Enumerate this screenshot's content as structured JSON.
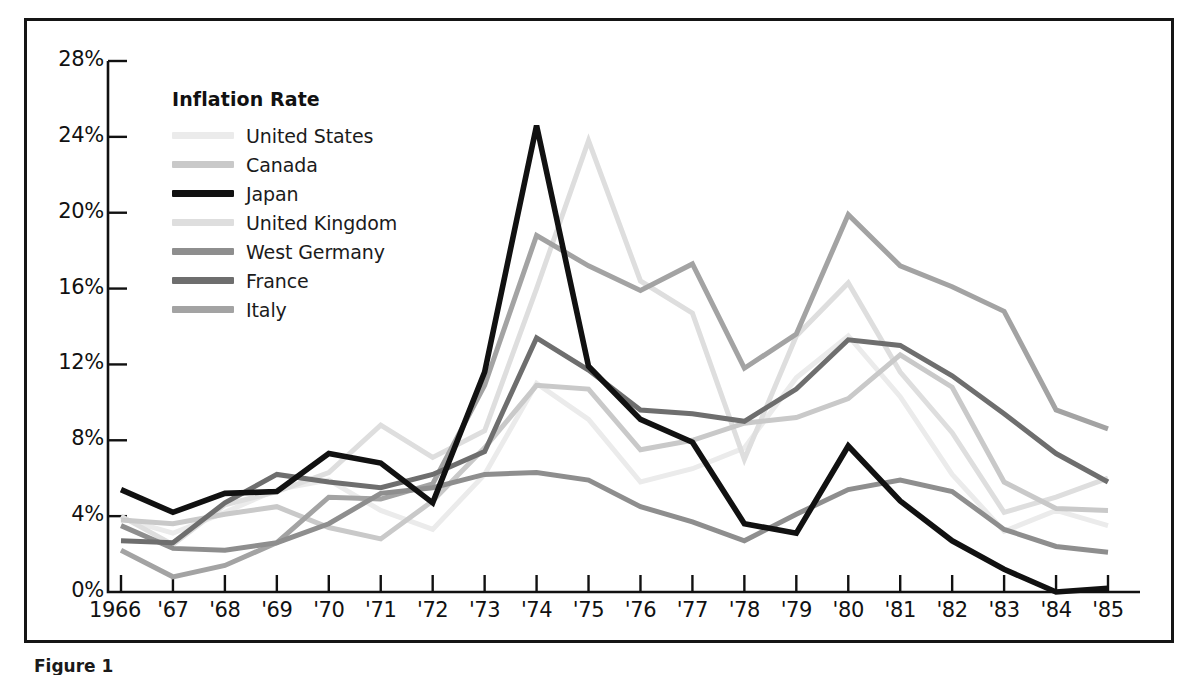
{
  "figure": {
    "caption": "Figure 1"
  },
  "legend": {
    "title": "Inflation Rate",
    "position": "inside-top-left",
    "entries": [
      {
        "label": "United States",
        "color": "#ebebeb"
      },
      {
        "label": "Canada",
        "color": "#c9c9c9"
      },
      {
        "label": "Japan",
        "color": "#111111"
      },
      {
        "label": "United Kingdom",
        "color": "#dedede"
      },
      {
        "label": "West Germany",
        "color": "#8e8e8e"
      },
      {
        "label": "France",
        "color": "#6e6e6e"
      },
      {
        "label": "Italy",
        "color": "#a3a3a3"
      }
    ]
  },
  "axes": {
    "y_ticks": [
      "0%",
      "4%",
      "8%",
      "12%",
      "16%",
      "20%",
      "24%",
      "28%"
    ],
    "x_ticks": [
      "1966",
      "'67",
      "'68",
      "'69",
      "'70",
      "'71",
      "'72",
      "'73",
      "'74",
      "'75",
      "'76",
      "'77",
      "'78",
      "'79",
      "'80",
      "'81",
      "'82",
      "'83",
      "'84",
      "'85"
    ]
  },
  "chart_data": {
    "type": "line",
    "title": "Inflation Rate",
    "xlabel": "",
    "ylabel": "Inflation Rate",
    "ylim": [
      0,
      28
    ],
    "ytick_values": [
      0,
      4,
      8,
      12,
      16,
      20,
      24,
      28
    ],
    "grid": false,
    "legend_position": "inside-top-left",
    "categories": [
      1966,
      1967,
      1968,
      1969,
      1970,
      1971,
      1972,
      1973,
      1974,
      1975,
      1976,
      1977,
      1978,
      1979,
      1980,
      1981,
      1982,
      1983,
      1984,
      1985
    ],
    "series": [
      {
        "name": "United States",
        "color": "#ebebeb",
        "values": [
          3.9,
          3.1,
          4.2,
          5.4,
          5.9,
          4.3,
          3.3,
          6.2,
          11.0,
          9.1,
          5.8,
          6.5,
          7.6,
          11.3,
          13.5,
          10.3,
          6.2,
          3.2,
          4.3,
          3.5
        ]
      },
      {
        "name": "Canada",
        "color": "#c9c9c9",
        "values": [
          3.8,
          3.6,
          4.1,
          4.5,
          3.4,
          2.8,
          4.8,
          7.6,
          10.9,
          10.7,
          7.5,
          8.0,
          8.9,
          9.2,
          10.2,
          12.5,
          10.8,
          5.8,
          4.4,
          4.3
        ]
      },
      {
        "name": "Japan",
        "color": "#111111",
        "values": [
          5.4,
          4.2,
          5.2,
          5.3,
          7.3,
          6.8,
          4.7,
          11.6,
          24.6,
          11.9,
          9.1,
          7.9,
          3.6,
          3.1,
          7.7,
          4.8,
          2.7,
          1.2,
          0.0,
          0.2
        ]
      },
      {
        "name": "United Kingdom",
        "color": "#dedede",
        "values": [
          4.0,
          2.5,
          4.6,
          5.3,
          6.3,
          8.8,
          7.1,
          8.5,
          16.0,
          23.8,
          16.4,
          14.7,
          7.0,
          13.5,
          16.3,
          11.6,
          8.4,
          4.2,
          5.0,
          6.0
        ]
      },
      {
        "name": "West Germany",
        "color": "#8e8e8e",
        "values": [
          3.5,
          2.3,
          2.2,
          2.6,
          3.6,
          5.2,
          5.5,
          6.2,
          6.3,
          5.9,
          4.5,
          3.7,
          2.7,
          4.1,
          5.4,
          5.9,
          5.3,
          3.3,
          2.4,
          2.1
        ]
      },
      {
        "name": "France",
        "color": "#6e6e6e",
        "values": [
          2.7,
          2.6,
          4.7,
          6.2,
          5.8,
          5.5,
          6.2,
          7.4,
          13.4,
          11.7,
          9.6,
          9.4,
          9.0,
          10.7,
          13.3,
          13.0,
          11.4,
          9.4,
          7.3,
          5.8
        ]
      },
      {
        "name": "Italy",
        "color": "#a3a3a3",
        "values": [
          2.2,
          0.8,
          1.4,
          2.6,
          5.0,
          4.9,
          5.7,
          10.9,
          18.8,
          17.2,
          15.9,
          17.3,
          11.8,
          13.6,
          19.9,
          17.2,
          16.1,
          14.8,
          9.6,
          8.6
        ]
      }
    ]
  }
}
